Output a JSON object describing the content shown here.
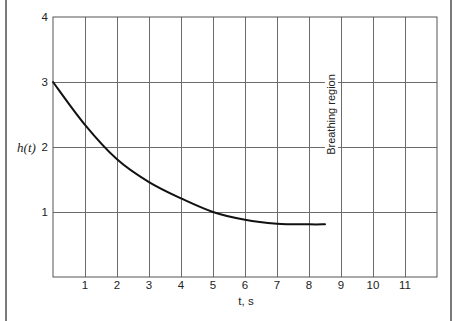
{
  "chart_data": {
    "type": "line",
    "title": "",
    "xlabel": "t, s",
    "ylabel": "h(t)",
    "xlim": [
      0,
      12
    ],
    "ylim": [
      0,
      4
    ],
    "grid": true,
    "legend": null,
    "x_ticks": [
      "1",
      "2",
      "3",
      "4",
      "5",
      "6",
      "7",
      "8",
      "9",
      "10",
      "11"
    ],
    "y_ticks": [
      "1",
      "2",
      "3",
      "4"
    ],
    "series": [
      {
        "name": "h(t)",
        "x": [
          0,
          1,
          2,
          3,
          4,
          5,
          6,
          7,
          8,
          8.5
        ],
        "y": [
          3.0,
          2.34,
          1.81,
          1.46,
          1.21,
          1.0,
          0.88,
          0.82,
          0.81,
          0.81
        ]
      }
    ],
    "annotations": [
      {
        "text": "Breathing region",
        "x": 8.7,
        "y": 2.5,
        "rotation": -90
      }
    ]
  },
  "colors": {
    "background": "#ffffff",
    "grid": "#6b6b6b",
    "plot_border": "#555555",
    "curve": "#111111",
    "frame": "#7a7a7a",
    "text": "#222222"
  }
}
